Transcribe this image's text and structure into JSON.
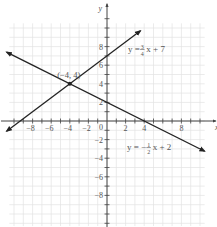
{
  "chart_data": {
    "type": "line",
    "title": "",
    "xlabel": "x",
    "ylabel": "y",
    "xlim": [
      -11.5,
      11.8
    ],
    "ylim": [
      -11.4,
      13
    ],
    "grid": true,
    "x_ticks": [
      -8,
      -6,
      -4,
      -2,
      2,
      4,
      8
    ],
    "y_ticks": [
      8,
      6,
      4,
      2,
      -2,
      -4,
      -6,
      -8
    ],
    "origin_label": "0",
    "series": [
      {
        "name": "y = 3/4 x + 7",
        "label_parts": {
          "prefix": "y = ",
          "num": "3",
          "den": "4",
          "suffix": "x + 7"
        },
        "slope": 0.75,
        "intercept": 7,
        "x": [
          -10.8,
          3.6
        ],
        "y": [
          -1.1,
          9.7
        ]
      },
      {
        "name": "y = -1/2 x + 2",
        "label_parts": {
          "prefix": "y = −",
          "num": "1",
          "den": "2",
          "suffix": "x + 2"
        },
        "slope": -0.5,
        "intercept": 2,
        "x": [
          -10.8,
          10.5
        ],
        "y": [
          7.4,
          -3.25
        ]
      }
    ],
    "annotations": [
      {
        "text": "(−4, 4)",
        "x": -4,
        "y": 4,
        "type": "point"
      }
    ]
  },
  "colors": {
    "grid": "#e2e2e2",
    "axis": "#444444",
    "line": "#222222",
    "text": "#555555"
  }
}
